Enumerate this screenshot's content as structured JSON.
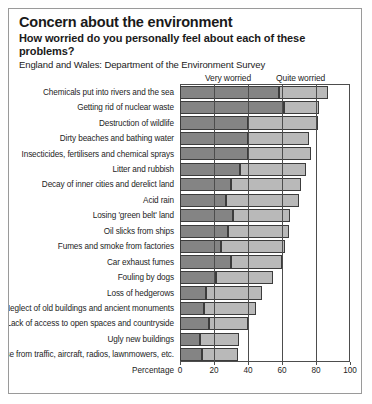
{
  "header": {
    "title": "Concern about the environment",
    "subtitle": "How worried do you personally feel about each of these problems?",
    "source": "England and Wales: Department of the Environment Survey"
  },
  "axis": {
    "label": "Percentage",
    "ticks": [
      "0",
      "20",
      "40",
      "60",
      "80",
      "100"
    ]
  },
  "legend": {
    "very": "Very worried",
    "quite": "Quite worried"
  },
  "colors": {
    "very": "#848484",
    "quite": "#b9b9b9",
    "frame": "#4d4d4d",
    "background": "#ffffff"
  },
  "chart_data": {
    "type": "bar",
    "orientation": "horizontal",
    "stacked": true,
    "title": "Concern about the environment",
    "subtitle": "How worried do you personally feel about each of these problems?",
    "source": "England and Wales: Department of the Environment Survey",
    "xlabel": "Percentage",
    "ylabel": "",
    "xlim": [
      0,
      100
    ],
    "xticks": [
      0,
      20,
      40,
      60,
      80,
      100
    ],
    "grid": true,
    "legend_position": "top",
    "categories": [
      "Chemicals put into rivers and the sea",
      "Getting rid of nuclear waste",
      "Destruction of wildlife",
      "Dirty beaches and bathing water",
      "Insecticides, fertilisers and chemical sprays",
      "Litter and rubbish",
      "Decay of inner cities and derelict land",
      "Acid rain",
      "Losing 'green belt' land",
      "Oil slicks from ships",
      "Fumes and smoke from factories",
      "Car exhaust fumes",
      "Fouling by dogs",
      "Loss of hedgerows",
      "Neglect of old buildings and ancient monuments",
      "Lack of access to open spaces and countryside",
      "Ugly new buildings",
      "Noise from traffic, aircraft, radios, lawnmowers, etc."
    ],
    "series": [
      {
        "name": "Very worried",
        "color": "#848484",
        "values": [
          58,
          61,
          40,
          40,
          40,
          35,
          30,
          27,
          31,
          28,
          24,
          30,
          21,
          15,
          14,
          17,
          12,
          13
        ]
      },
      {
        "name": "Quite worried",
        "color": "#b9b9b9",
        "values": [
          29,
          21,
          41,
          36,
          37,
          39,
          41,
          43,
          34,
          36,
          38,
          30,
          34,
          33,
          31,
          23,
          23,
          21
        ]
      }
    ],
    "totals": [
      87,
      82,
      81,
      76,
      77,
      74,
      71,
      70,
      65,
      64,
      62,
      60,
      55,
      48,
      45,
      40,
      35,
      34
    ]
  }
}
